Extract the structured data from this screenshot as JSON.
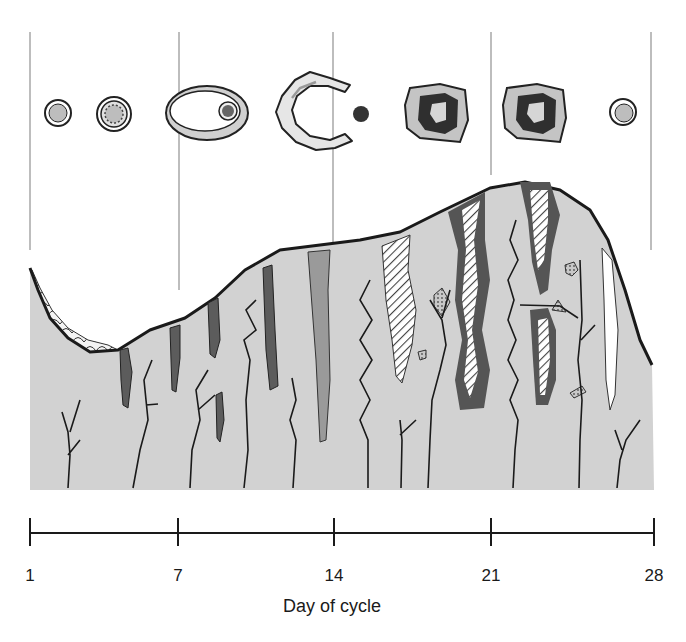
{
  "figure": {
    "axis": {
      "title": "Day of cycle",
      "ticks": [
        {
          "label": "1",
          "x": 30
        },
        {
          "label": "7",
          "x": 178
        },
        {
          "label": "14",
          "x": 334
        },
        {
          "label": "21",
          "x": 491
        },
        {
          "label": "28",
          "x": 654
        }
      ]
    },
    "ovarian_stages": [
      {
        "name": "primordial follicle",
        "x": 58
      },
      {
        "name": "primary follicle",
        "x": 114
      },
      {
        "name": "mature (Graafian) follicle",
        "x": 207
      },
      {
        "name": "ruptured follicle and released ovum",
        "x": 320
      },
      {
        "name": "corpus luteum",
        "x": 436
      },
      {
        "name": "corpus luteum",
        "x": 533
      },
      {
        "name": "new follicle",
        "x": 623
      }
    ],
    "phases": [
      "menstrual",
      "proliferative",
      "ovulation",
      "secretory",
      "ischemic"
    ],
    "colors": {
      "endometrium": "#d2d2d2",
      "gland_dark": "#5c5c5c",
      "gland_mid": "#9a9a9a",
      "outline": "#1a1a1a",
      "divider": "#bdbdbd"
    }
  }
}
